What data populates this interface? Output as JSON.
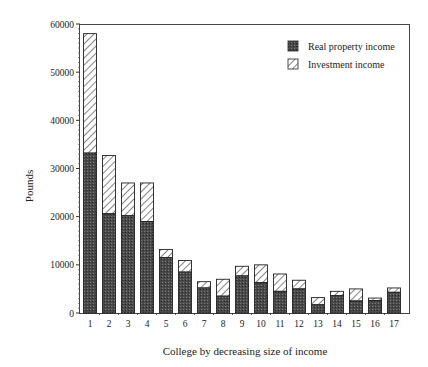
{
  "chart_data": {
    "type": "bar",
    "stacked": true,
    "title": "",
    "xlabel": "College by decreasing size of income",
    "ylabel": "Pounds",
    "ylim": [
      0,
      60000
    ],
    "yticks": [
      0,
      10000,
      20000,
      30000,
      40000,
      50000,
      60000
    ],
    "grid": false,
    "legend_position": "top-right",
    "categories": [
      "1",
      "2",
      "3",
      "4",
      "5",
      "6",
      "7",
      "8",
      "9",
      "10",
      "11",
      "12",
      "13",
      "14",
      "15",
      "16",
      "17"
    ],
    "series": [
      {
        "name": "Real property income",
        "pattern": "dark-stipple",
        "color": "#555555",
        "values": [
          33200,
          20600,
          20200,
          19000,
          11500,
          8500,
          5200,
          3500,
          7700,
          6300,
          4500,
          5000,
          1700,
          3600,
          2500,
          2600,
          4300
        ]
      },
      {
        "name": "Investment income",
        "pattern": "diagonal-hatch",
        "color": "#ffffff",
        "values": [
          24800,
          12100,
          6800,
          8000,
          1700,
          2400,
          1300,
          3500,
          2000,
          3700,
          3600,
          1800,
          1500,
          900,
          2500,
          500,
          900
        ]
      }
    ],
    "totals": [
      58000,
      32700,
      27000,
      27000,
      13200,
      10900,
      6500,
      7000,
      9700,
      10000,
      8100,
      6800,
      3200,
      4500,
      5000,
      3100,
      5200
    ]
  }
}
